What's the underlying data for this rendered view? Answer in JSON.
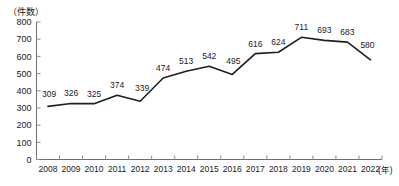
{
  "chart_data": {
    "type": "line",
    "title": "",
    "subtitle": "",
    "xlabel": "(年)",
    "ylabel": "（件数）",
    "ylim": [
      0,
      800
    ],
    "ytick_labels": [
      "800",
      "700",
      "600",
      "500",
      "400",
      "300",
      "200",
      "100",
      "0"
    ],
    "ytick_values": [
      800,
      700,
      600,
      500,
      400,
      300,
      200,
      100,
      0
    ],
    "grid": false,
    "legend": "none",
    "categories": [
      "2008",
      "2009",
      "2010",
      "2011",
      "2012",
      "2013",
      "2014",
      "2015",
      "2016",
      "2017",
      "2018",
      "2019",
      "2020",
      "2021",
      "2022"
    ],
    "values": [
      309,
      326,
      325,
      374,
      339,
      474,
      513,
      542,
      495,
      616,
      624,
      711,
      693,
      683,
      580
    ],
    "point_labels": [
      "309",
      "326",
      "325",
      "374",
      "339",
      "474",
      "513",
      "542",
      "495",
      "616",
      "624",
      "711",
      "693",
      "683",
      "580"
    ],
    "series": [
      {
        "name": "件数",
        "values": [
          309,
          326,
          325,
          374,
          339,
          474,
          513,
          542,
          495,
          616,
          624,
          711,
          693,
          683,
          580
        ],
        "color": "#1f1f1f"
      }
    ]
  },
  "colors": {
    "line": "#1f1f1f",
    "axis": "#6e6e6e",
    "text": "#1a1a1a",
    "background": "#ffffff"
  }
}
